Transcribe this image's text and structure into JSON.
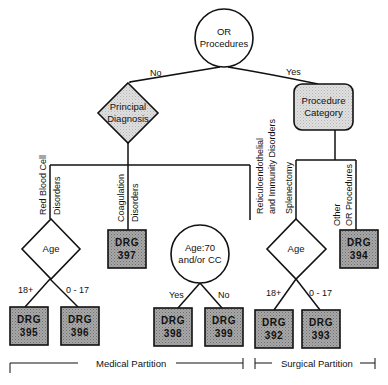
{
  "diagram": {
    "root": {
      "label_line1": "OR",
      "label_line2": "Procedures",
      "shape": "circle"
    },
    "root_edges": {
      "no": "No",
      "yes": "Yes"
    },
    "principal_diagnosis": {
      "label_line1": "Principal",
      "label_line2": "Diagnosis",
      "shape": "diamond"
    },
    "procedure_category": {
      "label_line1": "Procedure",
      "label_line2": "Category",
      "shape": "rounded-rect"
    },
    "medical_branches": {
      "red_blood_cell": {
        "line1": "Red Blood Cell",
        "line2": "Disorders"
      },
      "coagulation": {
        "line1": "Coagulation",
        "line2": "Disorders"
      },
      "reticuloendothelial": {
        "line1": "Reticuloendothelial",
        "line2": "and Immunity Disorders"
      }
    },
    "surgical_branches": {
      "splenectomy": {
        "line1": "Splenectomy"
      },
      "other_or": {
        "line1": "Other",
        "line2": "OR Procedures"
      }
    },
    "age_medical": {
      "label": "Age",
      "edge_left": "18+",
      "edge_right": "0 - 17"
    },
    "age_cc": {
      "label_line1": "Age:70",
      "label_line2": "and/or CC",
      "edge_left": "Yes",
      "edge_right": "No"
    },
    "age_surgical": {
      "label": "Age",
      "edge_left": "18+",
      "edge_right": "0 - 17"
    },
    "drg_boxes": [
      {
        "prefix": "DRG",
        "code": "395"
      },
      {
        "prefix": "DRG",
        "code": "396"
      },
      {
        "prefix": "DRG",
        "code": "397"
      },
      {
        "prefix": "DRG",
        "code": "398"
      },
      {
        "prefix": "DRG",
        "code": "399"
      },
      {
        "prefix": "DRG",
        "code": "392"
      },
      {
        "prefix": "DRG",
        "code": "393"
      },
      {
        "prefix": "DRG",
        "code": "394"
      }
    ],
    "partitions": {
      "medical": "Medical Partition",
      "surgical": "Surgical Partition"
    },
    "colors": {
      "line": "#111111",
      "drg_fill": "#9a9a9a",
      "light_fill": "#d6d6d6",
      "background": "#ffffff"
    }
  }
}
